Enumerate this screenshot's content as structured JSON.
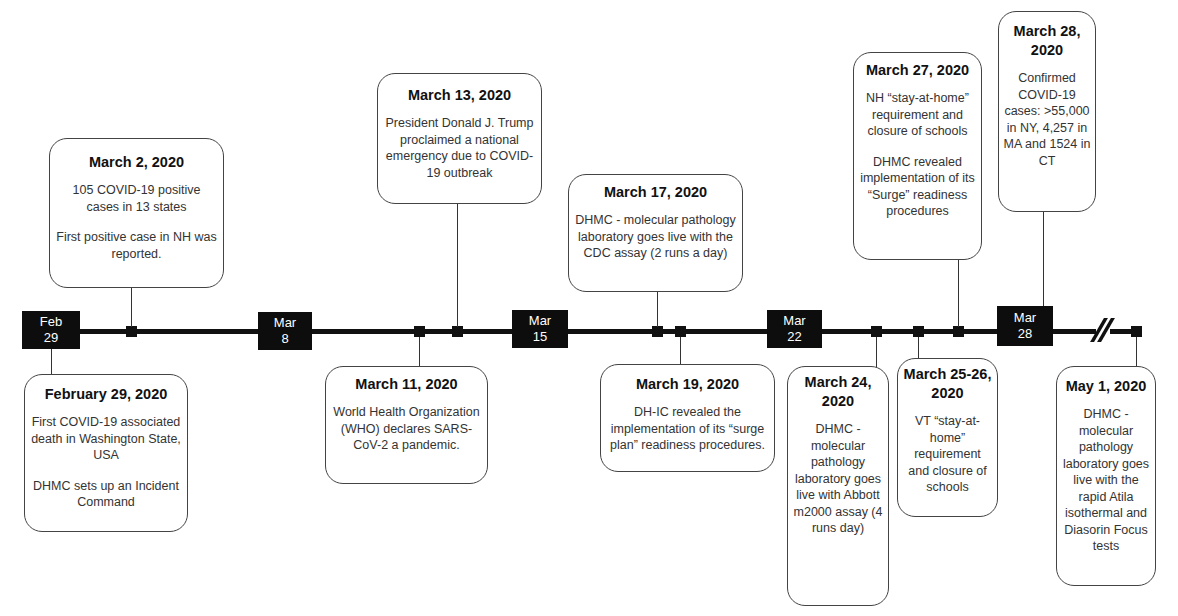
{
  "timeline": {
    "date_labels": [
      {
        "month": "Feb",
        "day": "29"
      },
      {
        "month": "Mar",
        "day": "8"
      },
      {
        "month": "Mar",
        "day": "15"
      },
      {
        "month": "Mar",
        "day": "22"
      },
      {
        "month": "Mar",
        "day": "28"
      }
    ]
  },
  "events": {
    "feb29": {
      "title": "February 29, 2020",
      "p1": "First COVID-19 associated death in Washington State, USA",
      "p2": "DHMC sets up an Incident Command"
    },
    "mar2": {
      "title": "March 2, 2020",
      "p1": "105 COVID-19 positive cases in 13 states",
      "p2": "First positive case in NH was reported."
    },
    "mar11": {
      "title": "March 11, 2020",
      "p1": "World Health Organization (WHO) declares SARS-CoV-2 a pandemic."
    },
    "mar13": {
      "title": "March 13, 2020",
      "p1": "President Donald J. Trump proclaimed a national emergency due to COVID-19 outbreak"
    },
    "mar17": {
      "title": "March 17, 2020",
      "p1": "DHMC - molecular pathology laboratory goes live with the CDC assay (2 runs a day)"
    },
    "mar19": {
      "title": "March 19, 2020",
      "p1": "DH-IC revealed the implementation of its “surge plan” readiness procedures."
    },
    "mar24": {
      "title": "March 24, 2020",
      "p1": "DHMC - molecular pathology laboratory goes live with Abbott m2000 assay (4 runs day)"
    },
    "mar25": {
      "title": "March 25-26, 2020",
      "p1": "VT “stay-at-home” requirement and closure of schools"
    },
    "mar27": {
      "title": "March 27, 2020",
      "p1": "NH “stay-at-home” requirement and closure of schools",
      "p2": "DHMC revealed implementation of its “Surge” readiness procedures"
    },
    "mar28": {
      "title": "March 28, 2020",
      "p1": "Confirmed COVID-19 cases: >55,000 in NY, 4,257 in MA and 1524 in CT"
    },
    "may1": {
      "title": "May 1, 2020",
      "p1": "DHMC - molecular pathology laboratory goes live with the rapid Atila isothermal and Diasorin Focus tests"
    }
  }
}
